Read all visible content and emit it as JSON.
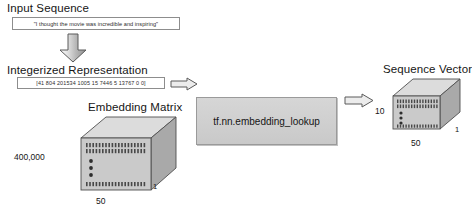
{
  "diagram": {
    "input_section": {
      "heading": "Input Sequence",
      "sentence": "\"I thought the movie was incredible and inspiring\""
    },
    "integerized_section": {
      "heading": "Integerized Representation",
      "array": "[41  804  201534  1005  15  7446  5  13767  0  0]"
    },
    "embedding_matrix": {
      "heading": "Embedding Matrix",
      "rows_label": "400,000",
      "cols_label": "50",
      "depth_label": "1"
    },
    "process": {
      "label": "tf.nn.embedding_lookup"
    },
    "sequence_vector": {
      "heading": "Sequence Vector",
      "rows_label": "10",
      "cols_label": "50",
      "depth_label": "1"
    },
    "arrows": {
      "down": "down-arrow",
      "to_process": "right-arrow",
      "to_output": "right-arrow"
    },
    "colors": {
      "face": "#c9c9c9",
      "top": "#d9d9d9",
      "side": "#a8a8a8",
      "cell": "#4a4a4a",
      "outline": "#4f4f4f",
      "arrow_fill": "#e8e8e8",
      "arrow_stroke": "#5a5a5a"
    }
  }
}
